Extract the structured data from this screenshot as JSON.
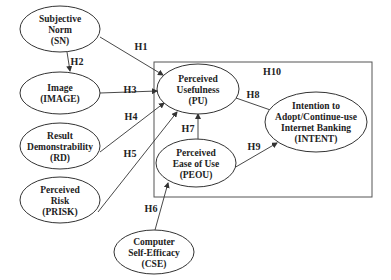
{
  "diagram": {
    "type": "research-model",
    "frame_label": "H10",
    "nodes": [
      {
        "id": "SN",
        "lines": [
          "Subjective",
          "Norm",
          "(SN)"
        ]
      },
      {
        "id": "IMAGE",
        "lines": [
          "Image",
          "(IMAGE)"
        ]
      },
      {
        "id": "RD",
        "lines": [
          "Result",
          "Demonstrability",
          "(RD)"
        ]
      },
      {
        "id": "PRISK",
        "lines": [
          "Perceived",
          "Risk",
          "(PRISK)"
        ]
      },
      {
        "id": "CSE",
        "lines": [
          "Computer",
          "Self-Efficacy",
          "(CSE)"
        ]
      },
      {
        "id": "PU",
        "lines": [
          "Perceived",
          "Usefulness",
          "(PU)"
        ]
      },
      {
        "id": "PEOU",
        "lines": [
          "Perceived",
          "Ease of Use",
          "(PEOU)"
        ]
      },
      {
        "id": "INTENT",
        "lines": [
          "Intention to",
          "Adopt/Continue-use",
          "Internet Banking",
          "(INTENT)"
        ]
      }
    ],
    "edges": [
      {
        "from": "SN",
        "to": "PU",
        "label": "H1"
      },
      {
        "from": "SN",
        "to": "IMAGE",
        "label": "H2"
      },
      {
        "from": "IMAGE",
        "to": "PU",
        "label": "H3"
      },
      {
        "from": "RD",
        "to": "PU",
        "label": "H4"
      },
      {
        "from": "PRISK",
        "to": "PU",
        "label": "H5"
      },
      {
        "from": "CSE",
        "to": "PEOU",
        "label": "H6"
      },
      {
        "from": "PEOU",
        "to": "PU",
        "label": "H7"
      },
      {
        "from": "PU",
        "to": "INTENT",
        "label": "H8"
      },
      {
        "from": "PEOU",
        "to": "INTENT",
        "label": "H9"
      }
    ]
  }
}
